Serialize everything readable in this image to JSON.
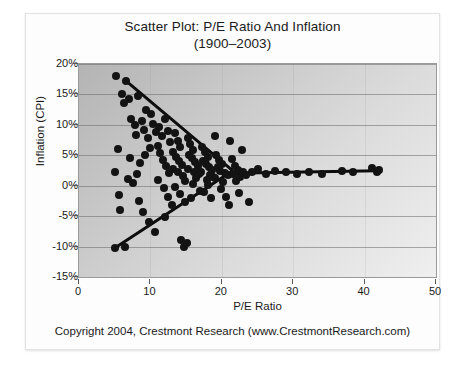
{
  "chart_data": {
    "type": "scatter",
    "title": "Scatter Plot: P/E Ratio And Inflation",
    "subtitle": "(1900–2003)",
    "xlabel": "P/E Ratio",
    "ylabel": "Inflation (CPI)",
    "xlim": [
      0,
      50
    ],
    "ylim": [
      -15,
      20
    ],
    "xticks": [
      0,
      10,
      20,
      30,
      40,
      50
    ],
    "xtick_labels": [
      "0",
      "10",
      "20",
      "30",
      "40",
      "50"
    ],
    "yticks": [
      20,
      15,
      10,
      5,
      0,
      -5,
      -10,
      -15
    ],
    "ytick_labels": [
      "20%",
      "15%",
      "10%",
      "5%",
      "0%",
      "-5%",
      "-10%",
      "-15%"
    ],
    "grid": "horizontal",
    "legend": "none",
    "marker_color": "#131313",
    "marker_size": 8,
    "plot_background": "#cccccc",
    "points": [
      [
        5.2,
        18.0
      ],
      [
        6.6,
        17.2
      ],
      [
        6.0,
        15.1
      ],
      [
        7.0,
        14.2
      ],
      [
        6.3,
        13.6
      ],
      [
        8.3,
        14.7
      ],
      [
        9.4,
        12.4
      ],
      [
        7.3,
        11.0
      ],
      [
        5.4,
        6.0
      ],
      [
        5.1,
        2.3
      ],
      [
        5.6,
        -1.6
      ],
      [
        5.8,
        -4.0
      ],
      [
        5.0,
        -10.3
      ],
      [
        6.4,
        -10.0
      ],
      [
        7.8,
        9.9
      ],
      [
        8.0,
        8.4
      ],
      [
        8.8,
        10.6
      ],
      [
        9.1,
        9.2
      ],
      [
        9.6,
        7.9
      ],
      [
        10.1,
        11.8
      ],
      [
        10.4,
        10.2
      ],
      [
        10.8,
        8.8
      ],
      [
        10.0,
        6.2
      ],
      [
        9.2,
        5.0
      ],
      [
        8.6,
        3.7
      ],
      [
        8.1,
        2.0
      ],
      [
        7.6,
        0.4
      ],
      [
        8.4,
        -2.5
      ],
      [
        9.0,
        -4.4
      ],
      [
        9.8,
        -6.0
      ],
      [
        10.6,
        -7.6
      ],
      [
        7.2,
        4.6
      ],
      [
        6.9,
        1.1
      ],
      [
        11.2,
        9.6
      ],
      [
        11.6,
        8.1
      ],
      [
        12.0,
        10.9
      ],
      [
        12.4,
        9.0
      ],
      [
        12.8,
        7.2
      ],
      [
        11.0,
        6.5
      ],
      [
        11.4,
        5.4
      ],
      [
        11.8,
        4.3
      ],
      [
        12.2,
        3.2
      ],
      [
        12.6,
        2.1
      ],
      [
        11.1,
        1.0
      ],
      [
        11.9,
        -0.4
      ],
      [
        12.5,
        -1.8
      ],
      [
        13.0,
        -3.2
      ],
      [
        12.1,
        -5.2
      ],
      [
        13.4,
        8.6
      ],
      [
        13.8,
        7.4
      ],
      [
        14.2,
        6.3
      ],
      [
        13.2,
        5.6
      ],
      [
        13.6,
        4.8
      ],
      [
        14.0,
        4.0
      ],
      [
        14.4,
        3.4
      ],
      [
        13.1,
        2.8
      ],
      [
        13.9,
        2.2
      ],
      [
        14.6,
        1.6
      ],
      [
        14.9,
        0.8
      ],
      [
        13.5,
        -0.2
      ],
      [
        14.1,
        -1.3
      ],
      [
        14.8,
        -2.6
      ],
      [
        14.3,
        -9.0
      ],
      [
        14.7,
        -10.0
      ],
      [
        15.1,
        -9.4
      ],
      [
        15.2,
        7.8
      ],
      [
        15.6,
        6.8
      ],
      [
        16.0,
        5.9
      ],
      [
        15.4,
        5.1
      ],
      [
        15.8,
        4.5
      ],
      [
        16.2,
        3.9
      ],
      [
        16.6,
        3.3
      ],
      [
        15.3,
        2.7
      ],
      [
        16.1,
        2.3
      ],
      [
        16.8,
        1.9
      ],
      [
        16.4,
        1.2
      ],
      [
        15.9,
        0.3
      ],
      [
        16.9,
        -0.8
      ],
      [
        15.7,
        -2.1
      ],
      [
        17.2,
        6.4
      ],
      [
        17.6,
        5.5
      ],
      [
        18.0,
        4.7
      ],
      [
        17.4,
        4.1
      ],
      [
        17.8,
        3.6
      ],
      [
        18.2,
        3.1
      ],
      [
        18.6,
        2.6
      ],
      [
        17.1,
        2.2
      ],
      [
        18.4,
        1.8
      ],
      [
        18.8,
        1.4
      ],
      [
        17.9,
        0.9
      ],
      [
        18.1,
        0.1
      ],
      [
        17.5,
        -1.0
      ],
      [
        18.5,
        -2.0
      ],
      [
        19.2,
        5.0
      ],
      [
        19.6,
        4.2
      ],
      [
        20.0,
        3.5
      ],
      [
        19.4,
        3.0
      ],
      [
        19.8,
        2.5
      ],
      [
        20.4,
        2.1
      ],
      [
        20.8,
        1.7
      ],
      [
        19.1,
        1.3
      ],
      [
        20.2,
        0.6
      ],
      [
        19.9,
        -0.5
      ],
      [
        20.6,
        -1.9
      ],
      [
        21.0,
        -3.1
      ],
      [
        21.4,
        4.4
      ],
      [
        21.8,
        3.3
      ],
      [
        22.2,
        2.6
      ],
      [
        21.6,
        2.0
      ],
      [
        22.6,
        1.5
      ],
      [
        22.0,
        0.7
      ],
      [
        23.0,
        2.3
      ],
      [
        23.4,
        1.8
      ],
      [
        22.4,
        -1.2
      ],
      [
        24.2,
        2.2
      ],
      [
        25.0,
        2.8
      ],
      [
        26.2,
        2.0
      ],
      [
        27.4,
        2.4
      ],
      [
        29.0,
        2.3
      ],
      [
        30.6,
        1.9
      ],
      [
        32.2,
        2.2
      ],
      [
        34.0,
        2.0
      ],
      [
        36.8,
        2.5
      ],
      [
        38.4,
        2.2
      ],
      [
        41.0,
        2.9
      ],
      [
        41.8,
        2.2
      ],
      [
        42.0,
        2.6
      ],
      [
        23.8,
        -2.6
      ],
      [
        21.2,
        7.3
      ],
      [
        19.0,
        8.2
      ],
      [
        22.8,
        5.8
      ]
    ],
    "trend_lines": [
      {
        "name": "declining-trend",
        "x1": 6.6,
        "y1": 17.2,
        "x2": 21.5,
        "y2": 2.5,
        "color": "#0d0d0d"
      },
      {
        "name": "rising-trend",
        "x1": 5.0,
        "y1": -10.2,
        "x2": 21.5,
        "y2": 2.5,
        "color": "#0d0d0d"
      },
      {
        "name": "flat-trend",
        "x1": 21.0,
        "y1": 2.1,
        "x2": 42.0,
        "y2": 2.5,
        "color": "#0d0d0d"
      }
    ]
  },
  "footer": {
    "copyright": "Copyright 2004, Crestmont Research (www.CrestmontResearch.com)"
  }
}
